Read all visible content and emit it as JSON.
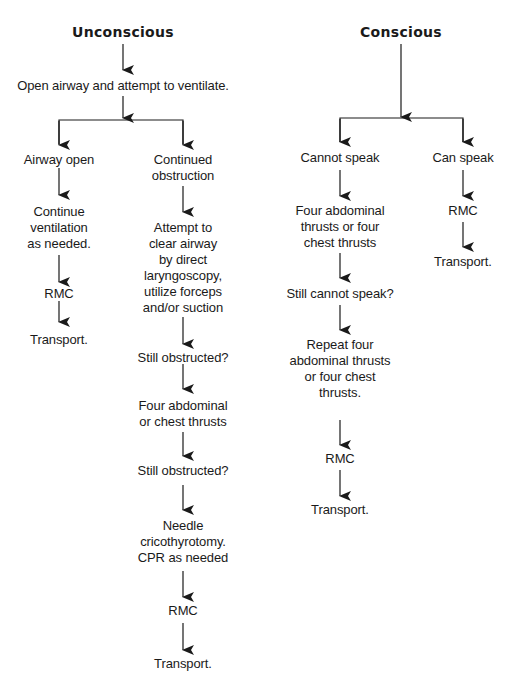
{
  "diagram": {
    "type": "flowchart",
    "branches": [
      {
        "title": "Unconscious",
        "first_step": "Open airway and attempt to ventilate.",
        "paths": [
          {
            "condition": "Airway open",
            "steps": [
              "Continue ventilation as needed.",
              "RMC",
              "Transport."
            ]
          },
          {
            "condition": "Continued obstruction",
            "steps": [
              "Attempt to clear airway by direct laryngoscopy, utilize forceps and/or suction",
              "Still obstructed?",
              "Four abdominal or chest thrusts",
              "Still obstructed?",
              "Needle cricothyrotomy. CPR as needed",
              "RMC",
              "Transport."
            ]
          }
        ]
      },
      {
        "title": "Conscious",
        "paths": [
          {
            "condition": "Cannot speak",
            "steps": [
              "Four abdominal thrusts or four chest thrusts",
              "Still cannot speak?",
              "Repeat four abdominal thrusts or four chest thrusts.",
              "RMC",
              "Transport."
            ]
          },
          {
            "condition": "Can speak",
            "steps": [
              "RMC",
              "Transport."
            ]
          }
        ]
      }
    ]
  },
  "labels": {
    "unconscious": "Unconscious",
    "open_airway": "Open airway and attempt to ventilate.",
    "airway_open": "Airway open",
    "continue_vent_1": "Continue",
    "continue_vent_2": "ventilation",
    "continue_vent_3": "as needed.",
    "left_rmc": "RMC",
    "left_transport": "Transport.",
    "cont_obs_1": "Continued",
    "cont_obs_2": "obstruction",
    "attempt_1": "Attempt to",
    "attempt_2": "clear airway",
    "attempt_3": "by direct",
    "attempt_4": "laryngoscopy,",
    "attempt_5": "utilize forceps",
    "attempt_6": "and/or suction",
    "still_obs_1": "Still obstructed?",
    "four_abd_1": "Four abdominal",
    "four_abd_2": "or chest thrusts",
    "still_obs_2": "Still obstructed?",
    "needle_1": "Needle",
    "needle_2": "cricothyrotomy.",
    "needle_3": "CPR as needed",
    "mid_rmc": "RMC",
    "mid_transport": "Transport.",
    "conscious": "Conscious",
    "cannot_speak": "Cannot speak",
    "can_speak": "Can speak",
    "four_thr_1": "Four abdominal",
    "four_thr_2": "thrusts or four",
    "four_thr_3": "chest thrusts",
    "still_cannot": "Still cannot speak?",
    "repeat_1": "Repeat four",
    "repeat_2": "abdominal thrusts",
    "repeat_3": "or four chest",
    "repeat_4": "thrusts.",
    "cs_rmc": "RMC",
    "cs_transport": "Transport.",
    "speak_rmc": "RMC",
    "speak_transport": "Transport."
  },
  "colors": {
    "ink": "#1a1a1a",
    "background": "#ffffff"
  }
}
